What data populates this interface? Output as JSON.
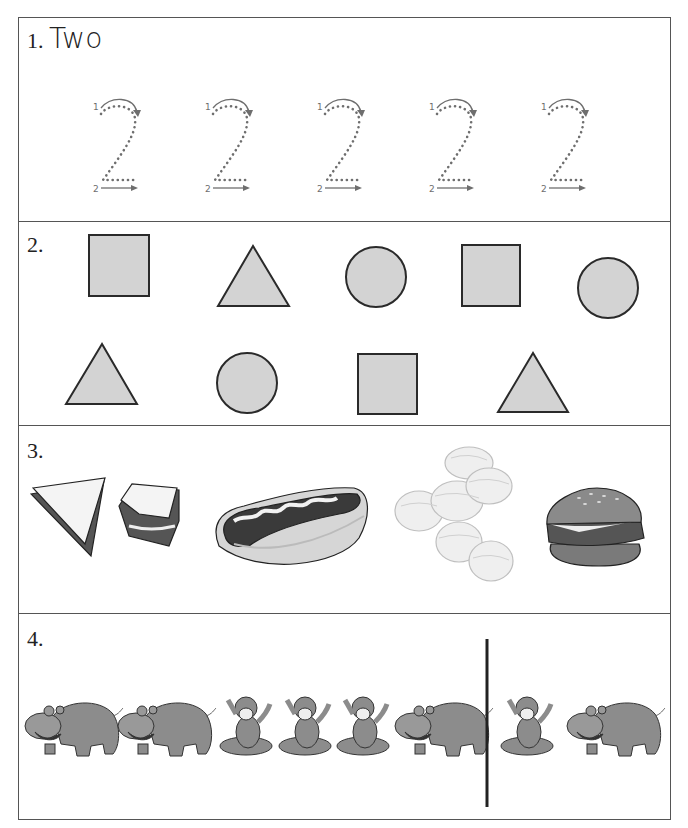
{
  "worksheet": {
    "sections": [
      {
        "number": "1.",
        "title": "Two",
        "tracing_digit": "2",
        "tracing_count": 5,
        "stroke_labels": [
          "1",
          "2"
        ]
      },
      {
        "number": "2.",
        "shapes_row1": [
          "square",
          "triangle",
          "circle",
          "square",
          "circle"
        ],
        "shapes_row2": [
          "triangle",
          "circle",
          "square",
          "triangle"
        ]
      },
      {
        "number": "3.",
        "items": [
          "sandwich",
          "hot dog",
          "potato chips",
          "hamburger"
        ]
      },
      {
        "number": "4.",
        "sequence_before_divider": [
          "hippo",
          "hippo",
          "monkey",
          "monkey",
          "monkey",
          "hippo"
        ],
        "sequence_after_divider": [
          "monkey",
          "hippo"
        ]
      }
    ]
  },
  "colors": {
    "border": "#555555",
    "shape_fill": "#d3d3d3",
    "shape_stroke": "#2a2a2a",
    "tracing": "#6e6e6e",
    "animal": "#8c8c8c"
  }
}
